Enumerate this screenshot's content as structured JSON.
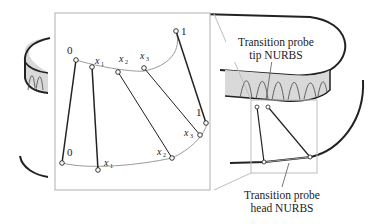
{
  "callouts": {
    "tip": {
      "line1": "Transition probe",
      "line2": "tip NURBS"
    },
    "head": {
      "line1": "Transition probe",
      "line2": "head NURBS"
    }
  },
  "inset_labels": {
    "top": [
      {
        "text": "0",
        "sub": ""
      },
      {
        "text": "x",
        "sub": "1"
      },
      {
        "text": "x",
        "sub": "2"
      },
      {
        "text": "x",
        "sub": "3"
      },
      {
        "text": "1",
        "sub": ""
      }
    ],
    "bottom": [
      {
        "text": "0",
        "sub": ""
      },
      {
        "text": "x",
        "sub": "1"
      },
      {
        "text": "x",
        "sub": "2"
      },
      {
        "text": "x",
        "sub": "3"
      },
      {
        "text": "1",
        "sub": ""
      }
    ]
  },
  "colors": {
    "stroke": "#222222",
    "curve": "#9a9a9a",
    "inset_border": "#bdbdbd",
    "surface_fill": "#d9d9d9"
  }
}
